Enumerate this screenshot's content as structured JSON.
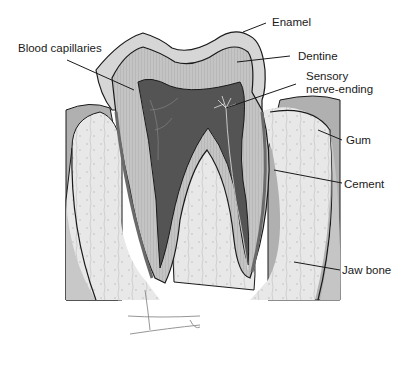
{
  "diagram": {
    "labels": {
      "enamel": "Enamel",
      "blood_capillaries": "Blood capillaries",
      "dentine": "Dentine",
      "sensory_nerve_line1": "Sensory",
      "sensory_nerve_line2": "nerve-ending",
      "gum": "Gum",
      "cement": "Cement",
      "jaw_bone": "Jaw bone"
    },
    "colors": {
      "background": "#ffffff",
      "enamel": "#d4d4d4",
      "dentine": "#bdbdbd",
      "pulp": "#555555",
      "gum": "#a9a9a9",
      "bone": "#e6e6e6",
      "outline": "#1a1a1a"
    }
  }
}
